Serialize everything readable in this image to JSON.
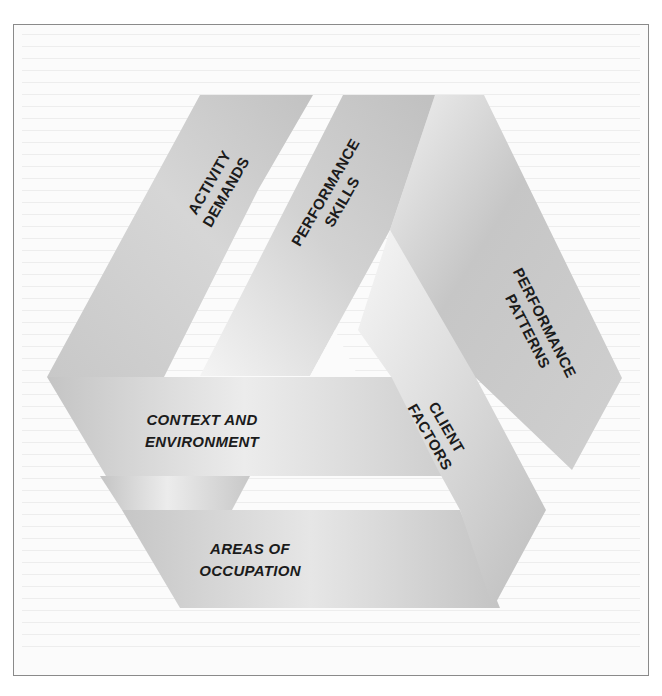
{
  "figure": {
    "type": "interlocking-triangle diagram",
    "colors": {
      "band_dark": "#c4c4c4",
      "band_light": "#f2f2f2",
      "label": "#1b1b1b",
      "frame_border": "#8a8a8a"
    },
    "labels": {
      "activity_demands": [
        "ACTIVITY",
        "DEMANDS"
      ],
      "performance_skills": [
        "PERFORMANCE",
        "SKILLS"
      ],
      "performance_patterns": [
        "PERFORMANCE",
        "PATTERNS"
      ],
      "context_environment": [
        "CONTEXT AND",
        "ENVIRONMENT"
      ],
      "client_factors": [
        "CLIENT",
        "FACTORS"
      ],
      "areas_of_occupation": [
        "AREAS OF",
        "OCCUPATION"
      ]
    }
  }
}
